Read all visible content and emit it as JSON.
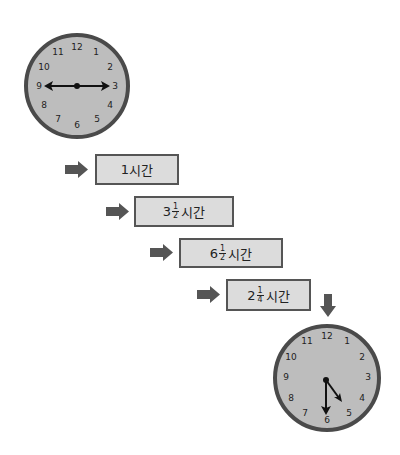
{
  "colors": {
    "clock_face": "#bdbdbd",
    "clock_rim": "#4a4a4a",
    "box_fill": "#dcdcdc",
    "box_border": "#555555",
    "arrow": "#555555",
    "text": "#222222"
  },
  "start_clock": {
    "numbers": [
      "12",
      "1",
      "2",
      "3",
      "4",
      "5",
      "6",
      "7",
      "8",
      "9",
      "10",
      "11"
    ],
    "time_shown": "2:45 (hands pointing to 9 and 3)"
  },
  "steps": [
    {
      "whole": "1",
      "num": "",
      "den": "",
      "unit": "시간"
    },
    {
      "whole": "3",
      "num": "1",
      "den": "2",
      "unit": "시간"
    },
    {
      "whole": "6",
      "num": "1",
      "den": "2",
      "unit": "시간"
    },
    {
      "whole": "2",
      "num": "1",
      "den": "4",
      "unit": "시간"
    }
  ],
  "end_clock": {
    "numbers": [
      "12",
      "1",
      "2",
      "3",
      "4",
      "5",
      "6",
      "7",
      "8",
      "9",
      "10",
      "11"
    ],
    "time_shown": "4:30"
  }
}
